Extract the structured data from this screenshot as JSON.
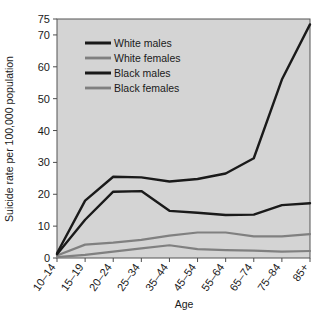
{
  "chart_data": {
    "type": "line",
    "title": "",
    "xlabel": "Age",
    "ylabel": "Suicide rate per 100,000 population",
    "categories": [
      "10–14",
      "15–19",
      "20–24",
      "25–34",
      "35–44",
      "45–54",
      "55–64",
      "65–74",
      "75–84",
      "85+"
    ],
    "yticks": [
      0,
      10,
      20,
      30,
      40,
      50,
      60,
      70,
      75
    ],
    "ytick_labels": [
      "0",
      "10",
      "20",
      "30",
      "40",
      "50",
      "60",
      "70",
      "75"
    ],
    "ylim": [
      0,
      75
    ],
    "grid": false,
    "legend_position": "upper-left-inside",
    "series": [
      {
        "name": "White males",
        "color": "#1a1a1a",
        "values": [
          1.5,
          18.0,
          25.5,
          25.3,
          24.0,
          24.8,
          26.5,
          31.3,
          56.0,
          73.3
        ]
      },
      {
        "name": "White females",
        "color": "#808080",
        "values": [
          0.8,
          4.2,
          4.8,
          5.7,
          7.0,
          8.0,
          8.0,
          6.8,
          6.8,
          7.5
        ]
      },
      {
        "name": "Black males",
        "color": "#1a1a1a",
        "values": [
          1.2,
          12.0,
          20.8,
          21.0,
          14.8,
          14.2,
          13.5,
          13.6,
          16.6,
          17.2
        ]
      },
      {
        "name": "Black females",
        "color": "#808080",
        "values": [
          0.3,
          1.0,
          2.0,
          3.0,
          4.0,
          2.8,
          2.5,
          2.3,
          2.0,
          2.2
        ]
      }
    ]
  },
  "legend": {
    "entries": [
      {
        "label": "White males"
      },
      {
        "label": "White females"
      },
      {
        "label": "Black males"
      },
      {
        "label": "Black females"
      }
    ]
  },
  "colors": {
    "plot_background": "#d4d4d4",
    "page_background": "#ffffff",
    "axis": "#4d4d4d",
    "dark_series": "#1a1a1a",
    "gray_series": "#808080"
  }
}
